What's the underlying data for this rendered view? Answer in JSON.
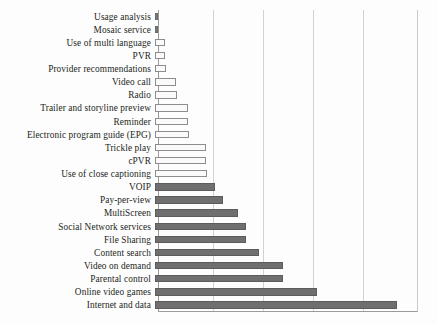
{
  "chart_data": {
    "type": "bar",
    "orientation": "horizontal",
    "title": "",
    "subtitle": "",
    "xlabel": "",
    "ylabel": "",
    "xlim": [
      0,
      26
    ],
    "grid": true,
    "gridlines_x": [
      5,
      10,
      15,
      20,
      25
    ],
    "legend": [],
    "legend_position": "none",
    "colors": {
      "light_series": "#fafafa",
      "dark_series": "#6f6f6f",
      "gridline": "#d2d2d2",
      "axis": "#9a9a9a",
      "text": "#231f20"
    },
    "categories": [
      "Usage analysis",
      "Mosaic service",
      "Use of multi language",
      "PVR",
      "Provider recommendations",
      "Video call",
      "Radio",
      "Trailer and storyline preview",
      "Reminder",
      "Electronic program guide (EPG)",
      "Trickle play",
      "cPVR",
      "Use of close captioning",
      "VOIP",
      "Pay-per-view",
      "MultiScreen",
      "Social Network services",
      "File Sharing",
      "Content search",
      "Video on demand",
      "Parental control",
      "Online video games",
      "Internet and data"
    ],
    "values": [
      0.3,
      0.3,
      1.0,
      1.0,
      1.1,
      2.1,
      2.2,
      3.3,
      3.3,
      3.4,
      5.1,
      5.1,
      5.2,
      6.0,
      6.8,
      8.3,
      9.1,
      9.1,
      10.4,
      12.8,
      12.8,
      16.2,
      24.2
    ],
    "series_style": [
      "zero",
      "zero",
      "light",
      "light",
      "light",
      "light",
      "light",
      "light",
      "light",
      "light",
      "light",
      "light",
      "light",
      "dark",
      "dark",
      "dark",
      "dark",
      "dark",
      "dark",
      "dark",
      "dark",
      "dark",
      "dark"
    ]
  }
}
